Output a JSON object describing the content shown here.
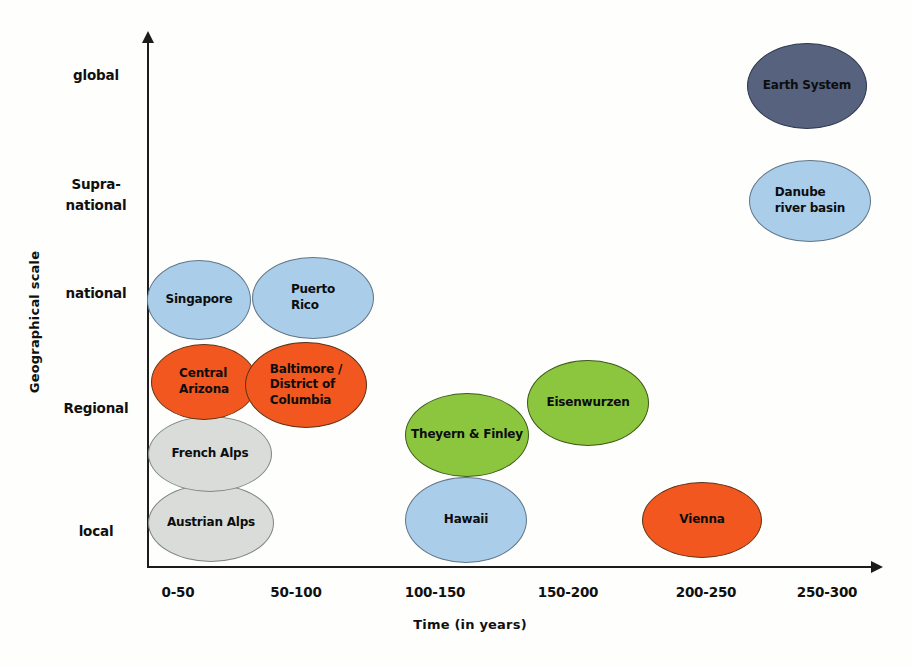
{
  "chart_data": {
    "type": "bubble",
    "title": "",
    "xlabel": "Time (in years)",
    "ylabel": "Geographical scale",
    "x_categories": [
      "0-50",
      "50-100",
      "100-150",
      "150-200",
      "200-250",
      "250-300"
    ],
    "y_categories": [
      "local",
      "Regional",
      "national",
      "Supra-national",
      "global"
    ],
    "grid": false,
    "legend": false,
    "palette": {
      "light_blue": {
        "fill": "#aacdea",
        "stroke": "#61768a"
      },
      "orange": {
        "fill": "#f1571e",
        "stroke": "#5f3318"
      },
      "gray": {
        "fill": "#d9dcd9",
        "stroke": "#7e8683"
      },
      "green": {
        "fill": "#8cc63e",
        "stroke": "#3d5a17"
      },
      "dark_blue": {
        "fill": "#56627e",
        "stroke": "#2e3a50"
      }
    },
    "bubbles": [
      {
        "id": "singapore",
        "lines": [
          "Singapore"
        ],
        "group": "light_blue",
        "align": "center",
        "time_range": "0-50",
        "geo_scale": "national",
        "cx": 199,
        "cy": 300,
        "rx": 52,
        "ry": 40
      },
      {
        "id": "puerto-rico",
        "lines": [
          "Puerto",
          "Rico"
        ],
        "group": "light_blue",
        "align": "left",
        "time_range": "50-100",
        "geo_scale": "national",
        "cx": 313,
        "cy": 298,
        "rx": 61,
        "ry": 41
      },
      {
        "id": "austrian-alps",
        "lines": [
          "Austrian Alps"
        ],
        "group": "gray",
        "align": "center",
        "time_range": "0-50",
        "geo_scale": "local",
        "cx": 211,
        "cy": 523,
        "rx": 63,
        "ry": 39
      },
      {
        "id": "french-alps",
        "lines": [
          "French Alps"
        ],
        "group": "gray",
        "align": "center",
        "time_range": "0-50",
        "geo_scale": "local-Regional",
        "cx": 210,
        "cy": 454,
        "rx": 62,
        "ry": 38
      },
      {
        "id": "central-arizona",
        "lines": [
          "Central",
          "Arizona"
        ],
        "group": "orange",
        "align": "left",
        "time_range": "0-50",
        "geo_scale": "Regional",
        "cx": 204,
        "cy": 382,
        "rx": 53,
        "ry": 38
      },
      {
        "id": "baltimore-district-of-columbia",
        "lines": [
          "Baltimore /",
          "District of",
          "Columbia"
        ],
        "group": "orange",
        "align": "left",
        "time_range": "50-100",
        "geo_scale": "Regional",
        "cx": 306,
        "cy": 385,
        "rx": 61,
        "ry": 43
      },
      {
        "id": "hawaii",
        "lines": [
          "Hawaii"
        ],
        "group": "light_blue",
        "align": "center",
        "time_range": "100-150",
        "geo_scale": "local",
        "cx": 466,
        "cy": 520,
        "rx": 61,
        "ry": 43
      },
      {
        "id": "theyern-and-finley",
        "lines": [
          "Theyern & Finley"
        ],
        "group": "green",
        "align": "center",
        "time_range": "100-150",
        "geo_scale": "Regional-local",
        "cx": 467,
        "cy": 435,
        "rx": 62,
        "ry": 42
      },
      {
        "id": "eisenwurzen",
        "lines": [
          "Eisenwurzen"
        ],
        "group": "green",
        "align": "center",
        "time_range": "150-200",
        "geo_scale": "Regional",
        "cx": 588,
        "cy": 403,
        "rx": 61,
        "ry": 43
      },
      {
        "id": "vienna",
        "lines": [
          "Vienna"
        ],
        "group": "orange",
        "align": "center",
        "time_range": "200-250",
        "geo_scale": "local",
        "cx": 702,
        "cy": 520,
        "rx": 60,
        "ry": 38
      },
      {
        "id": "earth-system",
        "lines": [
          "Earth System"
        ],
        "group": "dark_blue",
        "align": "center",
        "time_range": "250-300",
        "geo_scale": "global",
        "cx": 807,
        "cy": 86,
        "rx": 60,
        "ry": 43
      },
      {
        "id": "danube-river-basin",
        "lines": [
          "Danube",
          "river basin"
        ],
        "group": "light_blue",
        "align": "left",
        "time_range": "250-300",
        "geo_scale": "Supra-national",
        "cx": 810,
        "cy": 201,
        "rx": 61,
        "ry": 41
      }
    ]
  },
  "axes": {
    "y_ticks": [
      {
        "lines": [
          "global"
        ],
        "y": 75
      },
      {
        "lines": [
          "Supra-",
          "national"
        ],
        "y": 195
      },
      {
        "lines": [
          "national"
        ],
        "y": 293
      },
      {
        "lines": [
          "Regional"
        ],
        "y": 408
      },
      {
        "lines": [
          "local"
        ],
        "y": 531
      }
    ],
    "x_ticks": [
      {
        "label": "0-50",
        "x": 178
      },
      {
        "label": "50-100",
        "x": 296
      },
      {
        "label": "100-150",
        "x": 435
      },
      {
        "label": "150-200",
        "x": 568
      },
      {
        "label": "200-250",
        "x": 706
      },
      {
        "label": "250-300",
        "x": 827
      }
    ]
  }
}
